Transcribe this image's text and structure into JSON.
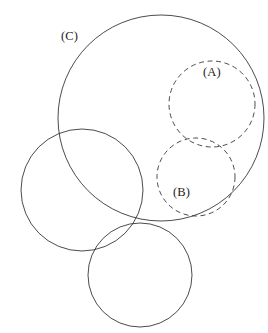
{
  "figure": {
    "background_color": "#ffffff",
    "stroke_color": "#2b2b2b",
    "width": 268,
    "height": 333,
    "labels": [
      {
        "text": "(C)",
        "x": 61,
        "y": 30,
        "for": "circle-c"
      },
      {
        "text": "(A)",
        "x": 203,
        "y": 66,
        "for": "circle-a"
      },
      {
        "text": "(B)",
        "x": 173,
        "y": 186,
        "for": "circle-b"
      }
    ]
  },
  "chart_data": {
    "type": "scatter",
    "title": "",
    "subtitle": "",
    "xlabel": "",
    "ylabel": "",
    "xlim": [
      0,
      268
    ],
    "ylim": [
      0,
      333
    ],
    "grid": false,
    "legend": "none",
    "annotations": [
      "(C)",
      "(A)",
      "(B)"
    ],
    "shapes": [
      {
        "name": "circle-c",
        "label": "(C)",
        "cx": 161,
        "cy": 118,
        "r": 103,
        "style": "solid"
      },
      {
        "name": "circle-a",
        "label": "(A)",
        "cx": 212,
        "cy": 104,
        "r": 43,
        "style": "dashed"
      },
      {
        "name": "circle-b",
        "label": "(B)",
        "cx": 196,
        "cy": 177,
        "r": 39,
        "style": "dashed"
      },
      {
        "name": "circle-left",
        "label": "",
        "cx": 82,
        "cy": 190,
        "r": 61,
        "style": "solid"
      },
      {
        "name": "circle-bottom",
        "label": "",
        "cx": 140,
        "cy": 275,
        "r": 52,
        "style": "solid"
      }
    ]
  }
}
